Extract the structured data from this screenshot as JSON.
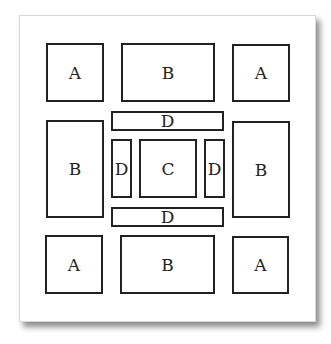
{
  "diagram": {
    "colors": {
      "paper": "#ffffff",
      "stroke": "#222222",
      "shadow": "#888888"
    },
    "boxes": [
      {
        "id": "a-top-left",
        "label": "A",
        "x": 46,
        "y": 43,
        "w": 58,
        "h": 59
      },
      {
        "id": "b-top",
        "label": "B",
        "x": 121,
        "y": 43,
        "w": 94,
        "h": 59
      },
      {
        "id": "a-top-right",
        "label": "A",
        "x": 232,
        "y": 44,
        "w": 58,
        "h": 58
      },
      {
        "id": "b-left",
        "label": "B",
        "x": 46,
        "y": 120,
        "w": 58,
        "h": 98
      },
      {
        "id": "d-top",
        "label": "D",
        "x": 111,
        "y": 111,
        "w": 113,
        "h": 20
      },
      {
        "id": "d-left",
        "label": "D",
        "x": 111,
        "y": 139,
        "w": 21,
        "h": 59
      },
      {
        "id": "c-center",
        "label": "C",
        "x": 139,
        "y": 139,
        "w": 58,
        "h": 59
      },
      {
        "id": "d-right",
        "label": "D",
        "x": 204,
        "y": 139,
        "w": 21,
        "h": 59
      },
      {
        "id": "b-right",
        "label": "B",
        "x": 232,
        "y": 121,
        "w": 58,
        "h": 97
      },
      {
        "id": "d-bottom",
        "label": "D",
        "x": 111,
        "y": 207,
        "w": 113,
        "h": 20
      },
      {
        "id": "a-bottom-left",
        "label": "A",
        "x": 45,
        "y": 235,
        "w": 58,
        "h": 59
      },
      {
        "id": "b-bottom",
        "label": "B",
        "x": 120,
        "y": 235,
        "w": 95,
        "h": 59
      },
      {
        "id": "a-bottom-right",
        "label": "A",
        "x": 232,
        "y": 236,
        "w": 57,
        "h": 58
      }
    ]
  }
}
